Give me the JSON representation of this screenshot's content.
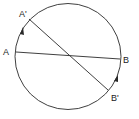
{
  "diagram": {
    "circle": {
      "cx": 68,
      "cy": 56.5,
      "r": 53,
      "stroke": "#2a2a2a"
    },
    "chords": [
      {
        "name": "AB",
        "from": "A",
        "to": "B"
      },
      {
        "name": "A'B'",
        "from": "A'",
        "to": "B'"
      }
    ],
    "points": {
      "A": {
        "label": "A",
        "x": 16,
        "y": 52
      },
      "B": {
        "label": "B",
        "x": 120,
        "y": 59
      },
      "A_prime": {
        "label": "A'",
        "x": 29,
        "y": 19
      },
      "B_prime": {
        "label": "B'",
        "x": 108,
        "y": 90
      }
    },
    "rotation_arrows": [
      {
        "from": "A",
        "to": "A'",
        "direction": "clockwise"
      },
      {
        "from": "B",
        "to": "B'",
        "direction": "clockwise"
      }
    ]
  }
}
